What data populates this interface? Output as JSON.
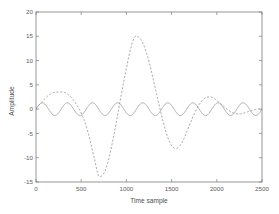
{
  "figure": {
    "background_color": "#ffffff",
    "frame_color": "#7d7d7d",
    "text_color": "#5b5b5b"
  },
  "chart_data": {
    "type": "line",
    "title": "",
    "subtitle": "",
    "xlabel": "Time sample",
    "ylabel": "Amplitude",
    "xlim": [
      0,
      2500
    ],
    "ylim": [
      -15,
      20
    ],
    "xticks": [
      0,
      500,
      1000,
      1500,
      2000,
      2500
    ],
    "yticks": [
      -15,
      -10,
      -5,
      0,
      5,
      10,
      15,
      20
    ],
    "xtick_labels": [
      "0",
      "500",
      "1000",
      "1500",
      "2000",
      "2500"
    ],
    "ytick_labels": [
      "-15",
      "-10",
      "-5",
      "0",
      "5",
      "10",
      "15",
      "20"
    ],
    "grid": false,
    "legend": false,
    "legend_position": "none",
    "annotations": [],
    "series": [
      {
        "name": "modulated-low-frequency-signal",
        "style": "dashed",
        "color": "#8a8a8a",
        "x": [
          0,
          50,
          100,
          150,
          200,
          250,
          300,
          350,
          400,
          450,
          500,
          550,
          600,
          650,
          680,
          700,
          750,
          800,
          850,
          900,
          950,
          1000,
          1050,
          1080,
          1100,
          1150,
          1200,
          1250,
          1300,
          1350,
          1400,
          1450,
          1500,
          1550,
          1600,
          1650,
          1700,
          1750,
          1800,
          1850,
          1900,
          1950,
          2000,
          2050,
          2100,
          2150,
          2200,
          2250,
          2300,
          2350,
          2400,
          2450,
          2500
        ],
        "y": [
          0.2,
          1.2,
          2.2,
          3.0,
          3.45,
          3.5,
          3.5,
          3.1,
          2.2,
          0.9,
          -0.8,
          -3.2,
          -6.6,
          -10.4,
          -13.0,
          -13.9,
          -13.2,
          -10.6,
          -6.4,
          -1.5,
          3.6,
          8.4,
          12.6,
          14.4,
          15.0,
          14.6,
          12.8,
          9.8,
          5.9,
          1.8,
          -2.1,
          -5.4,
          -7.5,
          -8.1,
          -7.3,
          -5.5,
          -3.2,
          -1.0,
          0.8,
          2.0,
          2.5,
          2.4,
          1.8,
          1.0,
          0.2,
          -0.5,
          -0.9,
          -1.0,
          -0.8,
          -0.5,
          -0.2,
          0.0,
          0.1
        ]
      },
      {
        "name": "high-frequency-carrier-signal",
        "style": "solid",
        "color": "#8f8f8f",
        "amplitude": 1.3,
        "cycles": 9,
        "x": [
          0,
          2500
        ],
        "y": [
          0,
          0
        ]
      }
    ]
  },
  "axes": {
    "x_axis_name": "Time sample",
    "y_axis_name": "Amplitude"
  }
}
